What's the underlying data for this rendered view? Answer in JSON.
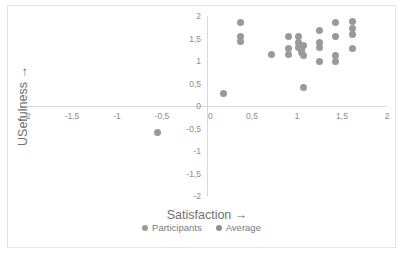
{
  "chart_data": {
    "type": "scatter",
    "title": "",
    "xlabel": "Satisfaction →",
    "ylabel": "USefulness →",
    "xlim": [
      -2,
      2
    ],
    "ylim": [
      -2,
      2
    ],
    "grid": false,
    "legend_position": "bottom",
    "x_tick_labels": [
      "-2",
      "-1,5",
      "-1",
      "-0,5",
      "0",
      "0,5",
      "1",
      "1,5",
      "2"
    ],
    "x_tick_values": [
      -2,
      -1.5,
      -1,
      -0.5,
      0,
      0.5,
      1,
      1.5,
      2
    ],
    "y_tick_labels": [
      "2",
      "1,5",
      "1",
      "0,5",
      "0",
      "-0,5",
      "-1",
      "-1,5",
      "-2"
    ],
    "y_tick_values": [
      2,
      1.5,
      1,
      0.5,
      0,
      -0.5,
      -1,
      -1.5,
      -2
    ],
    "marker_color": "#9a9a9a",
    "axis_color": "#d9d9d9",
    "series": [
      {
        "name": "Participants",
        "color": "#9a9a9a",
        "points": [
          [
            -0.55,
            -0.58
          ],
          [
            0.18,
            0.28
          ],
          [
            0.37,
            1.85
          ],
          [
            0.37,
            1.55
          ],
          [
            0.37,
            1.44
          ],
          [
            0.72,
            1.15
          ],
          [
            0.9,
            1.55
          ],
          [
            0.9,
            1.28
          ],
          [
            0.9,
            1.15
          ],
          [
            1.02,
            1.55
          ],
          [
            1.02,
            1.42
          ],
          [
            1.02,
            1.3
          ],
          [
            1.05,
            1.25
          ],
          [
            1.05,
            1.18
          ],
          [
            1.07,
            1.35
          ],
          [
            1.07,
            1.12
          ],
          [
            1.07,
            0.42
          ],
          [
            1.25,
            1.68
          ],
          [
            1.25,
            1.42
          ],
          [
            1.25,
            1.3
          ],
          [
            1.25,
            1.0
          ],
          [
            1.43,
            1.85
          ],
          [
            1.43,
            1.55
          ],
          [
            1.43,
            1.12
          ],
          [
            1.43,
            1.0
          ],
          [
            1.62,
            1.88
          ],
          [
            1.62,
            1.72
          ],
          [
            1.62,
            1.58
          ],
          [
            1.62,
            1.28
          ]
        ]
      },
      {
        "name": "Average",
        "color": "#8f8f8f",
        "points": []
      }
    ]
  },
  "legend": {
    "items": [
      {
        "label": "Participants"
      },
      {
        "label": "Average"
      }
    ]
  }
}
